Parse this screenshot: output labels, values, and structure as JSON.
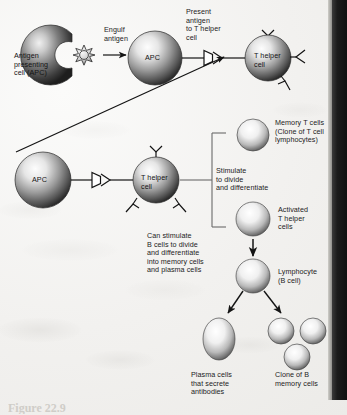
{
  "figure": {
    "caption": "Figure 22.9"
  },
  "colors": {
    "background": "#f4f3f1",
    "cell_dark": "#2f2f2f",
    "cell_mid": "#7c7c7c",
    "cell_light": "#f2f2f2",
    "ink": "#1c1c1c",
    "edge_band": "#141414"
  },
  "labels": {
    "antigen_presenting_cell": "Antigen\npresenting\ncell (APC)",
    "engulf_antigen": "Engulf\nantigen",
    "apc_top": "APC",
    "present_antigen": "Present\nantigen\nto T helper\ncell",
    "t_helper_top": "T helper\ncell",
    "apc_mid": "APC",
    "t_helper_mid": "T helper\ncell",
    "stimulate_divide": "Stimulate\nto divide\nand differentiate",
    "memory_t_cells": "Memory T cells\n(Clone of T cell\nlymphocytes)",
    "activated_t_helper": "Activated\nT helper\ncells",
    "can_stimulate_b": "Can stimulate\nB cells to divide\nand differentiate\ninto memory cells\nand plasma cells",
    "lymphocyte_b": "Lymphocyte\n(B cell)",
    "plasma_cells": "Plasma cells\nthat secrete\nantibodies",
    "clone_b_memory": "Clone of B\nmemory cells"
  },
  "cells": [
    {
      "name": "antigen-presenting-cell",
      "shape": "c-shape",
      "cx": 48,
      "cy": 55,
      "r": 30
    },
    {
      "name": "antigen",
      "shape": "star",
      "cx": 84,
      "cy": 55,
      "r": 9
    },
    {
      "name": "apc-top",
      "shape": "sphere",
      "cx": 155,
      "cy": 58,
      "r": 27
    },
    {
      "name": "t-helper-top",
      "shape": "sphere",
      "cx": 268,
      "cy": 58,
      "r": 23
    },
    {
      "name": "apc-mid",
      "shape": "sphere",
      "cx": 43,
      "cy": 180,
      "r": 28
    },
    {
      "name": "t-helper-mid",
      "shape": "sphere",
      "cx": 156,
      "cy": 180,
      "r": 23
    },
    {
      "name": "memory-t-cell",
      "shape": "sphere",
      "cx": 253,
      "cy": 135,
      "r": 16
    },
    {
      "name": "activated-t-helper",
      "shape": "sphere",
      "cx": 253,
      "cy": 219,
      "r": 17
    },
    {
      "name": "lymphocyte-b-cell",
      "shape": "sphere",
      "cx": 253,
      "cy": 276,
      "r": 17
    },
    {
      "name": "plasma-cell",
      "shape": "ellipse",
      "cx": 219,
      "cy": 339,
      "rx": 16,
      "ry": 21
    },
    {
      "name": "b-memory-cell-1",
      "shape": "sphere",
      "cx": 281,
      "cy": 333,
      "r": 13
    },
    {
      "name": "b-memory-cell-2",
      "shape": "sphere",
      "cx": 313,
      "cy": 333,
      "r": 13
    },
    {
      "name": "b-memory-cell-3",
      "shape": "sphere",
      "cx": 297,
      "cy": 358,
      "r": 13
    }
  ],
  "arrows": [
    {
      "name": "engulf-arrow",
      "from": [
        103,
        55
      ],
      "to": [
        128,
        55
      ]
    },
    {
      "name": "present-antigen-arrow",
      "from": [
        183,
        58
      ],
      "to": [
        245,
        58
      ]
    },
    {
      "name": "feedback-arrow",
      "from": [
        16,
        152
      ],
      "to": [
        226,
        57
      ]
    },
    {
      "name": "apc-to-thelper-mid-arrow",
      "from": [
        72,
        180
      ],
      "to": [
        133,
        180
      ]
    },
    {
      "name": "thelper-to-bracket-line",
      "from": [
        180,
        180
      ],
      "to": [
        212,
        180
      ]
    },
    {
      "name": "activated-to-lymphocyte-arrow",
      "from": [
        253,
        239
      ],
      "to": [
        253,
        258
      ]
    },
    {
      "name": "lymphocyte-to-plasma-arrow",
      "from": [
        242,
        292
      ],
      "to": [
        226,
        315
      ]
    },
    {
      "name": "lymphocyte-to-memory-arrow",
      "from": [
        265,
        292
      ],
      "to": [
        283,
        315
      ]
    }
  ]
}
